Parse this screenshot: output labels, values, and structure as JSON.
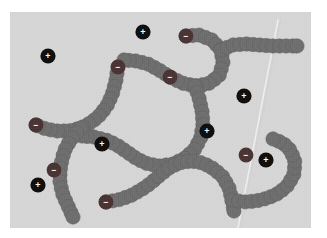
{
  "figure": {
    "background_color": "#ffffff",
    "panel_color": "#d8d8d8",
    "panel": {
      "x": 10,
      "y": 12,
      "width": 301,
      "height": 216
    }
  },
  "legend": {
    "chain_bead_label": "neutral monomer",
    "negative_label": "−",
    "positive_label": "+"
  },
  "colors": {
    "chain_bead": "#6e6e6e",
    "chain_bead_stroke": "#5f5f5f",
    "negative_ion": "#4a3333",
    "positive_ion": "#0d0d0d",
    "ion_text": "#ffffff",
    "crease": "#f2f2f2"
  },
  "geometry": {
    "bead_radius": 7.2,
    "ion_radius": 7.6,
    "chain_ion_radius": 7.4
  },
  "crease": {
    "name": "paper-crease",
    "x1": 268,
    "y1": 8,
    "x2": 228,
    "y2": 216,
    "width": 1.6
  },
  "chains": [
    {
      "name": "chain-upper-right",
      "points": [
        [
          176,
          24
        ],
        [
          189,
          23
        ],
        [
          202,
          28
        ],
        [
          211,
          38
        ],
        [
          213,
          51
        ],
        [
          209,
          64
        ],
        [
          198,
          72
        ],
        [
          185,
          74
        ],
        [
          172,
          71
        ],
        [
          160,
          65
        ],
        [
          149,
          58
        ],
        [
          138,
          52
        ],
        [
          126,
          49
        ],
        [
          114,
          48
        ]
      ]
    },
    {
      "name": "chain-right-arm",
      "points": [
        [
          211,
          38
        ],
        [
          223,
          33
        ],
        [
          236,
          32
        ],
        [
          249,
          33
        ],
        [
          262,
          34
        ],
        [
          275,
          34
        ],
        [
          287,
          34
        ]
      ]
    },
    {
      "name": "chain-center-descending",
      "points": [
        [
          185,
          74
        ],
        [
          189,
          86
        ],
        [
          192,
          99
        ],
        [
          193,
          112
        ],
        [
          191,
          125
        ],
        [
          185,
          137
        ],
        [
          175,
          146
        ],
        [
          163,
          152
        ],
        [
          150,
          154
        ],
        [
          138,
          152
        ],
        [
          127,
          147
        ],
        [
          117,
          140
        ],
        [
          107,
          133
        ],
        [
          96,
          128
        ],
        [
          84,
          125
        ],
        [
          72,
          124
        ]
      ]
    },
    {
      "name": "chain-left-upper",
      "points": [
        [
          108,
          55
        ],
        [
          106,
          68
        ],
        [
          103,
          80
        ],
        [
          98,
          92
        ],
        [
          91,
          102
        ],
        [
          82,
          110
        ],
        [
          71,
          116
        ],
        [
          59,
          119
        ],
        [
          47,
          119
        ],
        [
          36,
          117
        ],
        [
          26,
          113
        ]
      ]
    },
    {
      "name": "chain-left-lower",
      "points": [
        [
          71,
          116
        ],
        [
          63,
          125
        ],
        [
          56,
          135
        ],
        [
          52,
          147
        ],
        [
          50,
          159
        ],
        [
          50,
          171
        ],
        [
          53,
          183
        ],
        [
          58,
          194
        ],
        [
          63,
          205
        ]
      ]
    },
    {
      "name": "chain-lower-center",
      "points": [
        [
          96,
          190
        ],
        [
          108,
          188
        ],
        [
          120,
          184
        ],
        [
          131,
          178
        ],
        [
          141,
          171
        ],
        [
          150,
          163
        ],
        [
          159,
          156
        ],
        [
          169,
          151
        ],
        [
          181,
          149
        ],
        [
          193,
          151
        ],
        [
          204,
          157
        ],
        [
          213,
          165
        ],
        [
          219,
          176
        ],
        [
          222,
          188
        ],
        [
          224,
          199
        ]
      ]
    },
    {
      "name": "chain-lower-right-tail",
      "points": [
        [
          222,
          188
        ],
        [
          234,
          190
        ],
        [
          246,
          189
        ],
        [
          258,
          186
        ],
        [
          269,
          181
        ],
        [
          278,
          173
        ],
        [
          284,
          162
        ],
        [
          285,
          150
        ],
        [
          281,
          139
        ],
        [
          273,
          131
        ],
        [
          263,
          127
        ]
      ]
    }
  ],
  "chain_negative_ions": [
    {
      "name": "chain-neg-1",
      "x": 176,
      "y": 24,
      "sign": "−"
    },
    {
      "name": "chain-neg-2",
      "x": 108,
      "y": 55,
      "sign": "−"
    },
    {
      "name": "chain-neg-3",
      "x": 160,
      "y": 65,
      "sign": "−"
    },
    {
      "name": "chain-neg-4",
      "x": 26,
      "y": 113,
      "sign": "−"
    },
    {
      "name": "chain-neg-5",
      "x": 44,
      "y": 158,
      "sign": "−"
    },
    {
      "name": "chain-neg-6",
      "x": 96,
      "y": 190,
      "sign": "−"
    },
    {
      "name": "chain-neg-7",
      "x": 236,
      "y": 143,
      "sign": "−"
    }
  ],
  "free_positive_ions": [
    {
      "name": "pos-ion-1",
      "x": 133,
      "y": 20,
      "sign": "+"
    },
    {
      "name": "pos-ion-2",
      "x": 38,
      "y": 44,
      "sign": "+"
    },
    {
      "name": "pos-ion-3",
      "x": 234,
      "y": 84,
      "sign": "+"
    },
    {
      "name": "pos-ion-4",
      "x": 197,
      "y": 119,
      "sign": "+"
    },
    {
      "name": "pos-ion-5",
      "x": 92,
      "y": 132,
      "sign": "+"
    },
    {
      "name": "pos-ion-6",
      "x": 256,
      "y": 148,
      "sign": "+"
    },
    {
      "name": "pos-ion-7",
      "x": 28,
      "y": 173,
      "sign": "+"
    }
  ],
  "chart_data": {
    "type": "scatter",
    "xlabel": "",
    "ylabel": "",
    "xlim": [
      0,
      301
    ],
    "ylim": [
      0,
      216
    ],
    "grid": false,
    "legend_position": "none",
    "series": [
      {
        "name": "chain monomers (neutral)",
        "marker": "circle",
        "color": "#6e6e6e",
        "count": 78
      },
      {
        "name": "charged chain sites (−)",
        "marker": "circle",
        "color": "#4a3333",
        "count": 7
      },
      {
        "name": "free counter-ions (+)",
        "marker": "circle",
        "color": "#0d0d0d",
        "count": 7
      }
    ]
  }
}
